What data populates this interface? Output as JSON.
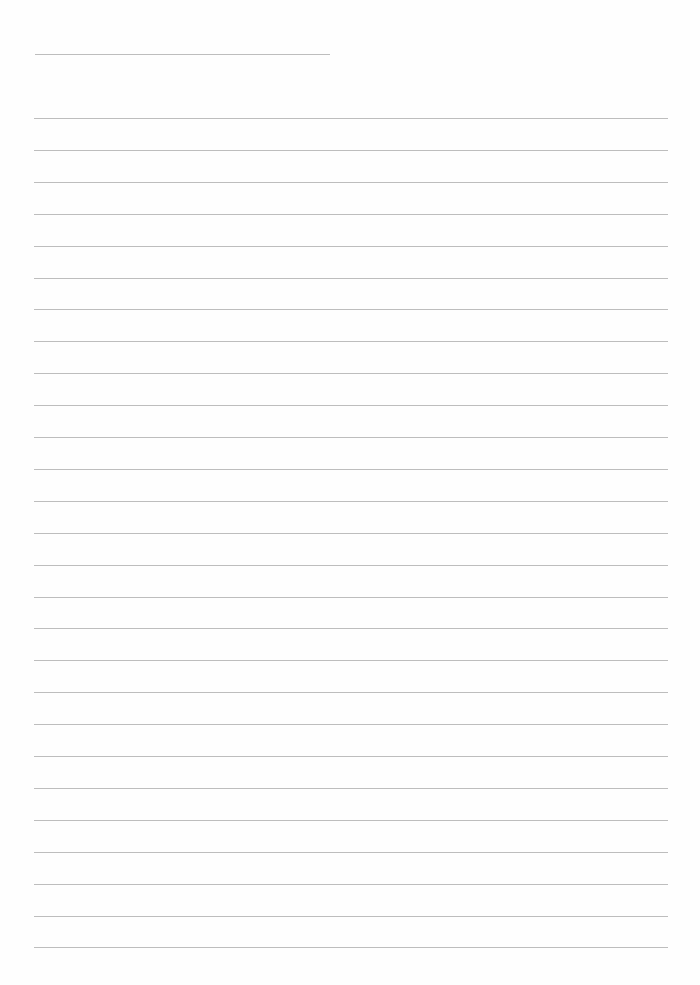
{
  "page": {
    "type": "lined-paper",
    "background": "#fefefe",
    "line_color": "#bdbdbd",
    "header_line": {
      "x": 35,
      "y": 54,
      "width": 295
    },
    "ruled_lines": {
      "count": 27,
      "first_y": 118,
      "spacing": 31.9,
      "x_start": 34,
      "x_end": 668
    }
  }
}
